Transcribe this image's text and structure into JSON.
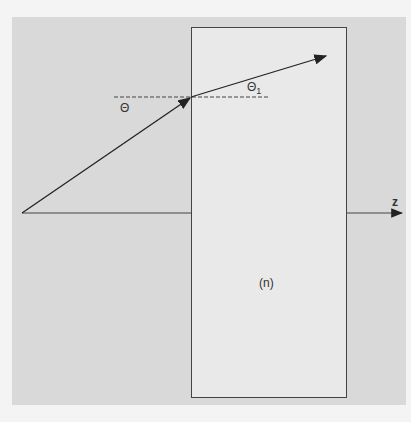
{
  "diagram": {
    "type": "refraction-diagram",
    "labels": {
      "incident_angle": "Θ",
      "refracted_angle": "Θ",
      "refracted_subscript": "1",
      "axis": "z",
      "medium": "(n)"
    },
    "colors": {
      "background": "#d9d9d9",
      "medium": "#e9e9e9",
      "line": "#222222"
    }
  }
}
